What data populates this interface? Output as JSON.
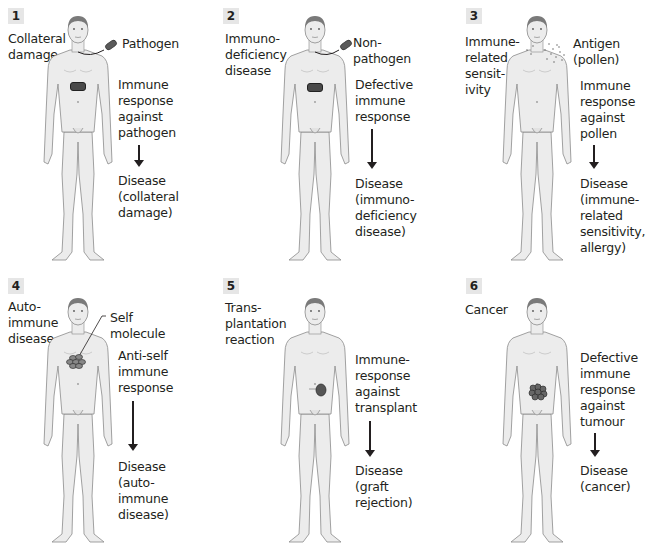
{
  "panels": [
    {
      "number": "1",
      "condition": "Collateral\ndamage",
      "agent": "Pathogen",
      "response": "Immune\nresponse\nagainst\npathogen",
      "outcome": "Disease\n(collateral\ndamage)",
      "agent_icon": "pathogen-bacterium-icon",
      "body_marker": "chest-bacterium"
    },
    {
      "number": "2",
      "condition": "Immuno-\ndeficiency\ndisease",
      "agent": "Non-pathogen",
      "response": "Defective\nimmune\nresponse",
      "outcome": "Disease\n(immuno-\ndeficiency\ndisease)",
      "agent_icon": "non-pathogen-bacterium-icon",
      "body_marker": "chest-bacterium"
    },
    {
      "number": "3",
      "condition": "Immune-\nrelated\nsensit-\nivity",
      "agent": "Antigen\n(pollen)",
      "response": "Immune\nresponse\nagainst\npollen",
      "outcome": "Disease\n(immune-\nrelated\nsensitivity,\nallergy)",
      "agent_icon": "pollen-dots-icon",
      "body_marker": "face-spots"
    },
    {
      "number": "4",
      "condition": "Auto-\nimmune\ndisease",
      "agent": "Self\nmolecule",
      "response": "Anti-self\nimmune\nresponse",
      "outcome": "Disease\n(auto-\nimmune\ndisease)",
      "agent_icon": "self-molecule-cluster-icon",
      "body_marker": "chest-cluster"
    },
    {
      "number": "5",
      "condition": "Trans-\nplantation\nreaction",
      "agent": "",
      "response": "Immune-\nresponse\nagainst\ntransplant",
      "outcome": "Disease\n(graft\nrejection)",
      "agent_icon": "kidney-transplant-icon",
      "body_marker": "abdomen-kidney"
    },
    {
      "number": "6",
      "condition": "Cancer",
      "agent": "",
      "response": "Defective\nimmune\nresponse\nagainst\ntumour",
      "outcome": "Disease\n(cancer)",
      "agent_icon": "tumour-icon",
      "body_marker": "abdomen-tumour"
    }
  ],
  "colors": {
    "skin": "#ececec",
    "outline": "#8a8a8a",
    "hair": "#7a7a7a",
    "marker": "#5a5a5a",
    "number_bg": "#e6e6e6",
    "text": "#231f20"
  }
}
